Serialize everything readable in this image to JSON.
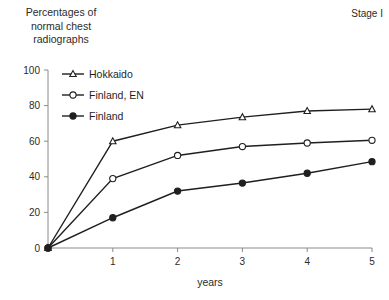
{
  "figure": {
    "stage_label": "Stage I",
    "y_axis_caption": "Percentages of\nnormal chest\nradiographs"
  },
  "chart_data": {
    "type": "line",
    "title": "",
    "subtitle": "Stage I",
    "xlabel": "years",
    "ylabel": "Percentages of normal chest radiographs",
    "x": [
      0,
      1,
      2,
      3,
      4,
      5
    ],
    "xlim": [
      0,
      5
    ],
    "ylim": [
      0,
      100
    ],
    "xticks": [
      1,
      2,
      3,
      4,
      5
    ],
    "xtick_labels": [
      "1",
      "2",
      "3",
      "4",
      "5"
    ],
    "yticks": [
      0,
      20,
      40,
      60,
      80,
      100
    ],
    "ytick_labels": [
      "0",
      "20",
      "40",
      "60",
      "80",
      "100"
    ],
    "grid": false,
    "legend_position": "upper left",
    "series": [
      {
        "name": "Hokkaido",
        "marker": "open-triangle",
        "color": "#1f1f1f",
        "values": [
          0,
          60,
          69,
          73.5,
          77,
          78
        ]
      },
      {
        "name": "Finland, EN",
        "marker": "open-circle",
        "color": "#1f1f1f",
        "values": [
          0,
          39,
          52,
          57,
          59,
          60.5
        ]
      },
      {
        "name": "Finland",
        "marker": "filled-circle",
        "color": "#1f1f1f",
        "values": [
          0,
          17,
          32,
          36.5,
          42,
          48.5
        ]
      }
    ]
  }
}
